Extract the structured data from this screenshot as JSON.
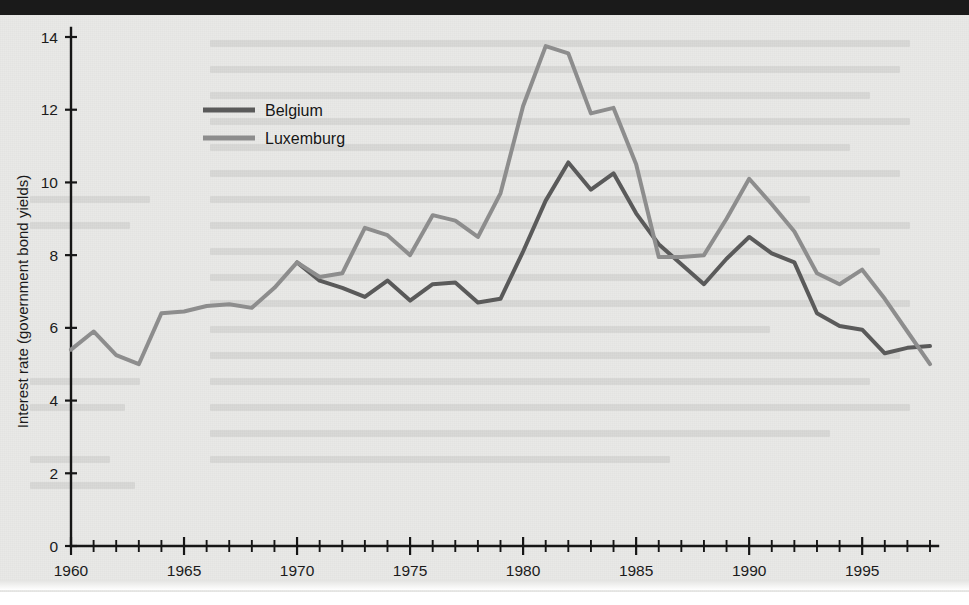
{
  "chart_data": {
    "type": "line",
    "title": "",
    "xlabel": "",
    "ylabel": "Interest rate (government bond yields)",
    "xlim": [
      1960,
      1998
    ],
    "ylim": [
      0,
      14
    ],
    "ytick_labels": [
      "0",
      "2",
      "4",
      "6",
      "8",
      "10",
      "12",
      "14"
    ],
    "yticks": [
      0,
      2,
      4,
      6,
      8,
      10,
      12,
      14
    ],
    "xtick_labels": [
      "1960",
      "1965",
      "1970",
      "1975",
      "1980",
      "1985",
      "1990",
      "1995"
    ],
    "xticks_major": [
      1960,
      1965,
      1970,
      1975,
      1980,
      1985,
      1990,
      1995
    ],
    "grid": false,
    "legend_position": "upper-left-inside",
    "x": [
      1960,
      1961,
      1962,
      1963,
      1964,
      1965,
      1966,
      1967,
      1968,
      1969,
      1970,
      1971,
      1972,
      1973,
      1974,
      1975,
      1976,
      1977,
      1978,
      1979,
      1980,
      1981,
      1982,
      1983,
      1984,
      1985,
      1986,
      1987,
      1988,
      1989,
      1990,
      1991,
      1992,
      1993,
      1994,
      1995,
      1996,
      1997,
      1998
    ],
    "series": [
      {
        "name": "Belgium",
        "color": "#5a5a5a",
        "values": [
          null,
          null,
          null,
          null,
          null,
          null,
          null,
          null,
          null,
          null,
          7.8,
          7.3,
          7.1,
          6.85,
          7.3,
          6.75,
          7.2,
          7.25,
          6.7,
          6.8,
          8.1,
          9.5,
          10.55,
          9.8,
          10.25,
          9.15,
          8.3,
          7.75,
          7.2,
          7.9,
          8.5,
          8.05,
          7.8,
          6.4,
          6.05,
          5.95,
          5.3,
          5.45,
          5.5
        ]
      },
      {
        "name": "Luxemburg",
        "color": "#8d8d8d",
        "values": [
          5.4,
          5.9,
          5.25,
          5.0,
          6.4,
          6.45,
          6.6,
          6.65,
          6.55,
          7.1,
          7.8,
          7.4,
          7.5,
          8.75,
          8.55,
          8.0,
          9.1,
          8.95,
          8.5,
          9.7,
          12.1,
          13.75,
          13.55,
          11.9,
          12.05,
          10.5,
          7.95,
          7.95,
          8.0,
          9.0,
          10.1,
          9.4,
          8.65,
          7.5,
          7.2,
          7.6,
          6.8,
          5.9,
          5.0
        ]
      }
    ]
  },
  "legend": {
    "items": [
      {
        "label": "Belgium",
        "color": "#5a5a5a"
      },
      {
        "label": "Luxemburg",
        "color": "#8d8d8d"
      }
    ]
  }
}
